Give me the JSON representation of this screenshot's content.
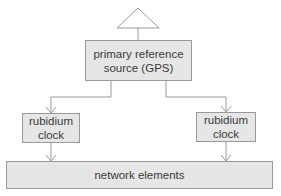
{
  "diagram": {
    "antenna": {
      "icon": "antenna-triangle-icon"
    },
    "primary_source": {
      "label": "primary reference\nsource (GPS)"
    },
    "clocks": [
      {
        "label": "rubidium\nclock"
      },
      {
        "label": "rubidium\nclock"
      }
    ],
    "network": {
      "label": "network elements"
    },
    "colors": {
      "box_fill": "#e6e6e6",
      "box_border": "#9a9a9a",
      "line": "#9a9a9a",
      "text": "#3a3a3a"
    }
  }
}
